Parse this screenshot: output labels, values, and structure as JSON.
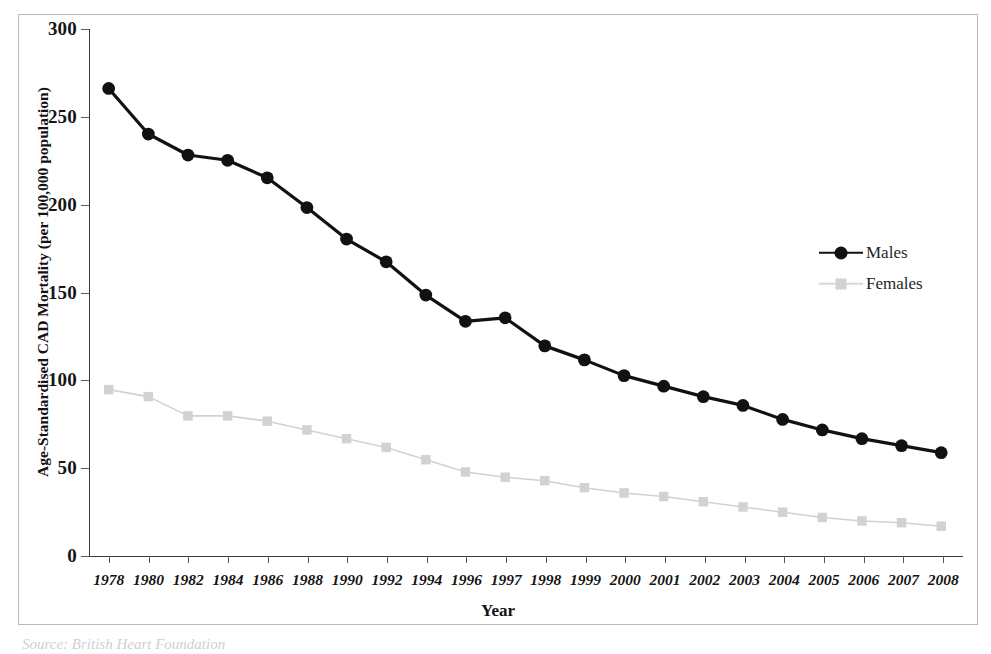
{
  "figure": {
    "x_axis_title": "Year",
    "y_axis_title": "Age-Standardised CAD Mortality (per 100,000 population)",
    "caption_remnant": "Source: British Heart Foundation"
  },
  "legend": {
    "position": "right-inside",
    "entries": [
      {
        "label": "Males",
        "color": "#111111",
        "marker": "circle"
      },
      {
        "label": "Females",
        "color": "#d2d2d2",
        "marker": "square"
      }
    ]
  },
  "colors": {
    "males": "#111111",
    "females": "#d2d2d2",
    "axis": "#3a3a3a",
    "frame": "#b9b9b9",
    "text": "#141414"
  },
  "chart_data": {
    "type": "line",
    "title": "",
    "xlabel": "Year",
    "ylabel": "Age-Standardised CAD Mortality (per 100,000 population)",
    "categories": [
      "1978",
      "1980",
      "1982",
      "1984",
      "1986",
      "1988",
      "1990",
      "1992",
      "1994",
      "1996",
      "1997",
      "1998",
      "1999",
      "2000",
      "2001",
      "2002",
      "2003",
      "2004",
      "2005",
      "2006",
      "2007",
      "2008"
    ],
    "ylim": [
      0,
      300
    ],
    "yticks": [
      0,
      50,
      100,
      150,
      200,
      250,
      300
    ],
    "grid": false,
    "series": [
      {
        "name": "Males",
        "color": "#111111",
        "marker": "circle",
        "values": [
          266,
          240,
          228,
          225,
          215,
          198,
          180,
          167,
          148,
          133,
          135,
          119,
          111,
          102,
          96,
          90,
          85,
          77,
          71,
          66,
          62,
          58
        ]
      },
      {
        "name": "Females",
        "color": "#d2d2d2",
        "marker": "square",
        "values": [
          94,
          90,
          79,
          79,
          76,
          71,
          66,
          61,
          54,
          47,
          44,
          42,
          38,
          35,
          33,
          30,
          27,
          24,
          21,
          19,
          18,
          16
        ]
      }
    ]
  }
}
